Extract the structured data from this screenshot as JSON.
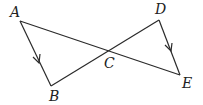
{
  "diagram": {
    "points": {
      "A": {
        "x": 20,
        "y": 21,
        "label": "A",
        "lx": 10,
        "ly": 17
      },
      "B": {
        "x": 51,
        "y": 86,
        "label": "B",
        "lx": 49,
        "ly": 101
      },
      "C": {
        "x": 109,
        "y": 51,
        "label": "C",
        "lx": 104,
        "ly": 68
      },
      "D": {
        "x": 159,
        "y": 20,
        "label": "D",
        "lx": 155,
        "ly": 14
      },
      "E": {
        "x": 180,
        "y": 75,
        "label": "E",
        "lx": 182,
        "ly": 88
      }
    },
    "segments": [
      {
        "from": "A",
        "to": "E"
      },
      {
        "from": "B",
        "to": "D"
      },
      {
        "from": "A",
        "to": "B"
      },
      {
        "from": "D",
        "to": "E"
      }
    ],
    "parallel_marks": [
      {
        "segment": "AB",
        "style": "single-arrow"
      },
      {
        "segment": "DE",
        "style": "single-arrow"
      }
    ],
    "colors": {
      "stroke": "#2a2a2a",
      "label": "#222222",
      "background": "#ffffff"
    }
  }
}
